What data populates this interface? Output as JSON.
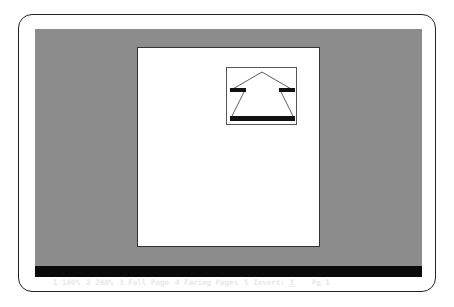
{
  "statusbar": {
    "items": [
      {
        "key": "1",
        "label": "100%"
      },
      {
        "key": "2",
        "label": "200%"
      },
      {
        "key": "3",
        "label": "Full Page"
      },
      {
        "key": "4",
        "label": "Facing Pages"
      },
      {
        "key": "5",
        "label": "Invert:"
      }
    ],
    "invert_value": "3",
    "page_label": "Pg",
    "page_number": "1"
  },
  "colors": {
    "screen_bg": "#8c8c8c",
    "page_bg": "#ffffff",
    "statusbar_bg": "#0a0a0a",
    "statusbar_text": "#e8e8e8"
  },
  "page": {
    "graphic": "up-arrow-icon"
  }
}
